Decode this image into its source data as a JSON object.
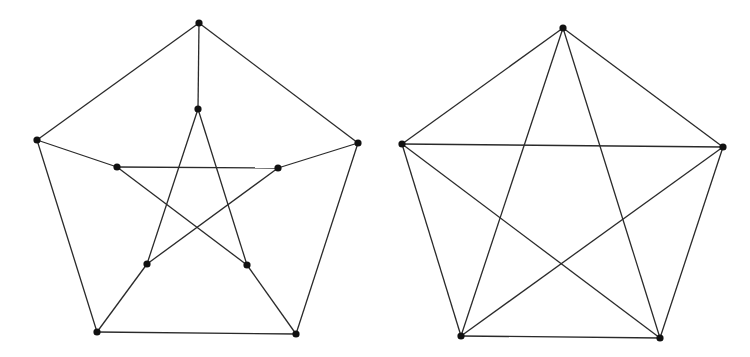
{
  "diagram": {
    "graphs": [
      {
        "name": "petersen-graph",
        "vertices": [
          {
            "id": "o0",
            "x": 199,
            "y": 23
          },
          {
            "id": "o1",
            "x": 358,
            "y": 143
          },
          {
            "id": "o2",
            "x": 296,
            "y": 334
          },
          {
            "id": "o3",
            "x": 97,
            "y": 332
          },
          {
            "id": "o4",
            "x": 37,
            "y": 140
          },
          {
            "id": "i0",
            "x": 198,
            "y": 109
          },
          {
            "id": "i1",
            "x": 278,
            "y": 168
          },
          {
            "id": "i2",
            "x": 247,
            "y": 265
          },
          {
            "id": "i3",
            "x": 147,
            "y": 264
          },
          {
            "id": "i4",
            "x": 117,
            "y": 167
          }
        ],
        "edges": [
          [
            "o0",
            "o1"
          ],
          [
            "o1",
            "o2"
          ],
          [
            "o2",
            "o3"
          ],
          [
            "o3",
            "o4"
          ],
          [
            "o4",
            "o0"
          ],
          [
            "o0",
            "i0"
          ],
          [
            "o1",
            "i1"
          ],
          [
            "o2",
            "i2"
          ],
          [
            "o3",
            "i3"
          ],
          [
            "o4",
            "i4"
          ],
          [
            "i0",
            "i2"
          ],
          [
            "i2",
            "i4"
          ],
          [
            "i4",
            "i1"
          ],
          [
            "i1",
            "i3"
          ],
          [
            "i3",
            "i0"
          ]
        ]
      },
      {
        "name": "complete-graph-k5",
        "vertices": [
          {
            "id": "a",
            "x": 563,
            "y": 28
          },
          {
            "id": "b",
            "x": 723,
            "y": 147
          },
          {
            "id": "c",
            "x": 660,
            "y": 338
          },
          {
            "id": "d",
            "x": 461,
            "y": 336
          },
          {
            "id": "e",
            "x": 402,
            "y": 144
          }
        ],
        "edges": [
          [
            "a",
            "b"
          ],
          [
            "b",
            "c"
          ],
          [
            "c",
            "d"
          ],
          [
            "d",
            "e"
          ],
          [
            "e",
            "a"
          ],
          [
            "a",
            "c"
          ],
          [
            "a",
            "d"
          ],
          [
            "b",
            "d"
          ],
          [
            "b",
            "e"
          ],
          [
            "c",
            "e"
          ]
        ]
      }
    ],
    "colors": {
      "edge": "#2a2a2a",
      "vertex": "#111111",
      "background": "#ffffff"
    },
    "vertex_radius": 3.6
  }
}
